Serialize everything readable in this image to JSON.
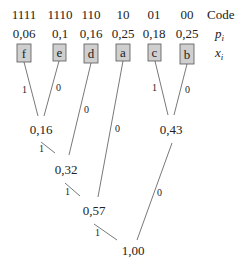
{
  "header_labels": {
    "code": "Code",
    "prob": "p",
    "prob_sub": "i",
    "symbol": "x",
    "symbol_sub": "i"
  },
  "leaves": [
    {
      "code": "1111",
      "p": "0,06",
      "x": "f"
    },
    {
      "code": "1110",
      "p": "0,1",
      "x": "e"
    },
    {
      "code": "110",
      "p": "0,16",
      "x": "d"
    },
    {
      "code": "10",
      "p": "0,25",
      "x": "a"
    },
    {
      "code": "01",
      "p": "0,18",
      "x": "c"
    },
    {
      "code": "00",
      "p": "0,25",
      "x": "b"
    }
  ],
  "internal_nodes": [
    {
      "id": "n016",
      "value": "0,16"
    },
    {
      "id": "n043",
      "value": "0,43"
    },
    {
      "id": "n032",
      "value": "0,32"
    },
    {
      "id": "n057",
      "value": "0,57"
    },
    {
      "id": "n100",
      "value": "1,00"
    }
  ],
  "edge_labels": {
    "f_to_016": "1",
    "e_to_016": "0",
    "d_to_032": "0",
    "a_to_057": "0",
    "c_to_043": "1",
    "b_to_043": "0",
    "n016_to_032": "1",
    "n032_to_057": "1",
    "n057_to_100": "1",
    "n043_to_100": "0"
  },
  "colors": {
    "box_fill": "#cfcfcf",
    "box_stroke": "#555555",
    "line": "#555555",
    "text": "#222222"
  }
}
